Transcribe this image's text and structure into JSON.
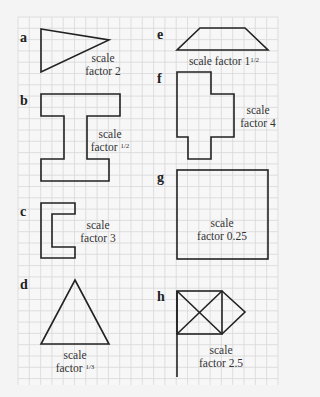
{
  "grid": {
    "x0": 18,
    "y0": 17,
    "x1": 278,
    "y1": 385,
    "cell": 11.3,
    "line_color": "#d6d6d6",
    "bg": "#f6f6f6"
  },
  "shape_color": "#222222",
  "items": [
    {
      "label": "a",
      "caption_line1": "scale",
      "caption_line2": "factor 2"
    },
    {
      "label": "b",
      "caption_line1": "scale",
      "caption_line2": "factor",
      "fraction": "1/2"
    },
    {
      "label": "c",
      "caption_line1": "scale",
      "caption_line2": "factor 3"
    },
    {
      "label": "d",
      "caption_line1": "scale",
      "caption_line2": "factor",
      "fraction": "1/3"
    },
    {
      "label": "e",
      "caption_line1": "scale factor 1",
      "fraction": "1/2"
    },
    {
      "label": "f",
      "caption_line1": "scale",
      "caption_line2": "factor 4"
    },
    {
      "label": "g",
      "caption_line1": "scale",
      "caption_line2": "factor 0.25"
    },
    {
      "label": "h",
      "caption_line1": "scale",
      "caption_line2": "factor 2.5"
    }
  ]
}
